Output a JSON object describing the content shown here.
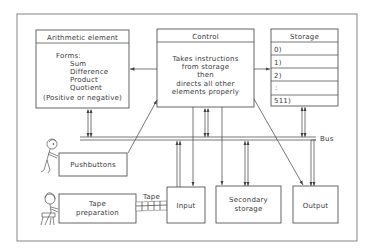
{
  "diagram": {
    "type": "computer-architecture-block-diagram",
    "arithmetic": {
      "title": "Arithmetic element",
      "lines": [
        "Forms:",
        "Sum",
        "Difference",
        "Product",
        "Quotient",
        "(Positive or negative)"
      ]
    },
    "control": {
      "title": "Control",
      "lines": [
        "Takes instructions",
        "from storage",
        "then",
        "directs all other",
        "elements properly"
      ]
    },
    "storage": {
      "title": "Storage",
      "rows": [
        "0)",
        "1)",
        "2)",
        ":",
        "511)"
      ]
    },
    "bus_label": "Bus",
    "pushbuttons": {
      "label": "Pushbuttons"
    },
    "tape_preparation": {
      "lines": [
        "Tape",
        "preparation"
      ]
    },
    "tape_label": "Tape",
    "input": {
      "label": "Input"
    },
    "secondary_storage": {
      "lines": [
        "Secondary",
        "storage"
      ]
    },
    "output": {
      "label": "Output"
    },
    "figures": [
      "person-at-pushbuttons",
      "person-at-tape-preparation"
    ]
  }
}
